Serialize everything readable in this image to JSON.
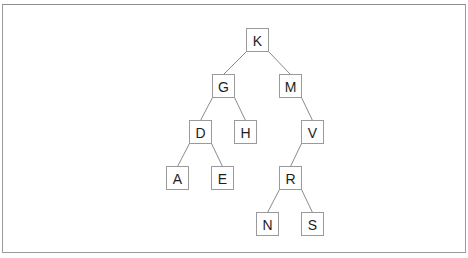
{
  "diagram": {
    "type": "binary-search-tree",
    "node_size": {
      "w": 22,
      "h": 23
    },
    "colors": {
      "frame_border": "#9a9a9a",
      "node_border": "#9a9a9a",
      "edge": "#8a8a8a",
      "label": "#1e1e1e",
      "background": "#ffffff"
    },
    "nodes": [
      {
        "id": "K",
        "label": "K",
        "x": 246,
        "y": 28
      },
      {
        "id": "G",
        "label": "G",
        "x": 212,
        "y": 74
      },
      {
        "id": "M",
        "label": "M",
        "x": 279,
        "y": 74
      },
      {
        "id": "D",
        "label": "D",
        "x": 189,
        "y": 120
      },
      {
        "id": "H",
        "label": "H",
        "x": 234,
        "y": 120
      },
      {
        "id": "V",
        "label": "V",
        "x": 301,
        "y": 120
      },
      {
        "id": "A",
        "label": "A",
        "x": 166,
        "y": 166
      },
      {
        "id": "E",
        "label": "E",
        "x": 211,
        "y": 166
      },
      {
        "id": "R",
        "label": "R",
        "x": 279,
        "y": 166
      },
      {
        "id": "N",
        "label": "N",
        "x": 256,
        "y": 212
      },
      {
        "id": "S",
        "label": "S",
        "x": 301,
        "y": 212
      }
    ],
    "edges": [
      {
        "from": "K",
        "to": "G",
        "side": "left"
      },
      {
        "from": "K",
        "to": "M",
        "side": "right"
      },
      {
        "from": "G",
        "to": "D",
        "side": "left"
      },
      {
        "from": "G",
        "to": "H",
        "side": "right"
      },
      {
        "from": "M",
        "to": "V",
        "side": "right"
      },
      {
        "from": "D",
        "to": "A",
        "side": "left"
      },
      {
        "from": "D",
        "to": "E",
        "side": "right"
      },
      {
        "from": "V",
        "to": "R",
        "side": "left"
      },
      {
        "from": "R",
        "to": "N",
        "side": "left"
      },
      {
        "from": "R",
        "to": "S",
        "side": "right"
      }
    ]
  }
}
